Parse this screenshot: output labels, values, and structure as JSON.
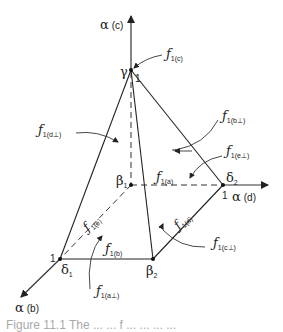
{
  "figure": {
    "axes": {
      "c": {
        "label": "α",
        "subscript": "(c)"
      },
      "d": {
        "label": "α",
        "subscript": "(d)"
      },
      "b": {
        "label": "α",
        "subscript": "(b)"
      }
    },
    "vertices": {
      "gamma": {
        "label": "γ",
        "unit": "1"
      },
      "beta1": {
        "label": "β",
        "subscript": "1"
      },
      "beta2": {
        "label": "β",
        "subscript": "2"
      },
      "delta1": {
        "label": "δ",
        "subscript": "1",
        "unit": "1"
      },
      "delta2": {
        "label": "δ",
        "subscript": "2",
        "unit": "1"
      }
    },
    "faces_and_edges": {
      "f1c": {
        "base": "ƒ",
        "subscript": "1(c)"
      },
      "f1d_perp": {
        "base": "ƒ",
        "subscript": "1(d⊥)"
      },
      "f1b_perp": {
        "base": "ƒ",
        "subscript": "1(b⊥)"
      },
      "f1e_perp": {
        "base": "ƒ",
        "subscript": "1(e⊥)"
      },
      "f1a": {
        "base": "ƒ",
        "subscript": "1(a)"
      },
      "f1e": {
        "base": "ƒ",
        "subscript": "1(e)"
      },
      "f1d": {
        "base": "ƒ",
        "subscript": "1(d)"
      },
      "f1c_perp": {
        "base": "ƒ",
        "subscript": "1(c⊥)"
      },
      "f1b": {
        "base": "ƒ",
        "subscript": "1(b)"
      },
      "f1a_perp": {
        "base": "ƒ",
        "subscript": "1(a⊥)"
      }
    },
    "caption": "Figure 11.1  The ... ... f ... ... ... ..."
  }
}
